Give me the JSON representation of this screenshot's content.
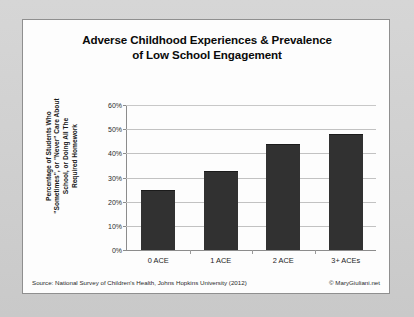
{
  "card": {
    "title_line1": "Adverse Childhood Experiences & Prevalence",
    "title_line2": "of Low School Engagement",
    "source_note": "Source: National Survey of Children's Health, Johns Hopkins University (2012)",
    "copyright": "© MaryGiuliani.net"
  },
  "axis": {
    "ylabel_line1": "Percentage of Students Who",
    "ylabel_line2": "\"Sometimes\", or \"Never\" Care About",
    "ylabel_line3": "School, or Doing All The",
    "ylabel_line4": "Required Homework"
  },
  "chart_data": {
    "type": "bar",
    "title": "Adverse Childhood Experiences & Prevalence of Low School Engagement",
    "subtitle": "",
    "categories": [
      "0 ACE",
      "1 ACE",
      "2 ACE",
      "3+ ACEs"
    ],
    "values": [
      25,
      32.5,
      44,
      48
    ],
    "value_unit": "percent",
    "series": [
      {
        "name": "Percentage of Students Who \"Sometimes\", or \"Never\" Care About School, or Doing All The Required Homework",
        "values": [
          25,
          32.5,
          44,
          48
        ]
      }
    ],
    "xlabel": "",
    "ylabel": "Percentage of Students Who \"Sometimes\", or \"Never\" Care About School, or Doing All The Required Homework",
    "ylim": [
      0,
      60
    ],
    "ytick_values": [
      0,
      10,
      20,
      30,
      40,
      50,
      60
    ],
    "ytick_labels": [
      "0%",
      "10%",
      "20%",
      "30%",
      "40%",
      "50%",
      "60%"
    ],
    "grid": true,
    "grid_axis": "y",
    "legend": false,
    "legend_position": "none",
    "bar_color": "#313131",
    "plot_background": "#fdfdfd",
    "annotations": []
  }
}
